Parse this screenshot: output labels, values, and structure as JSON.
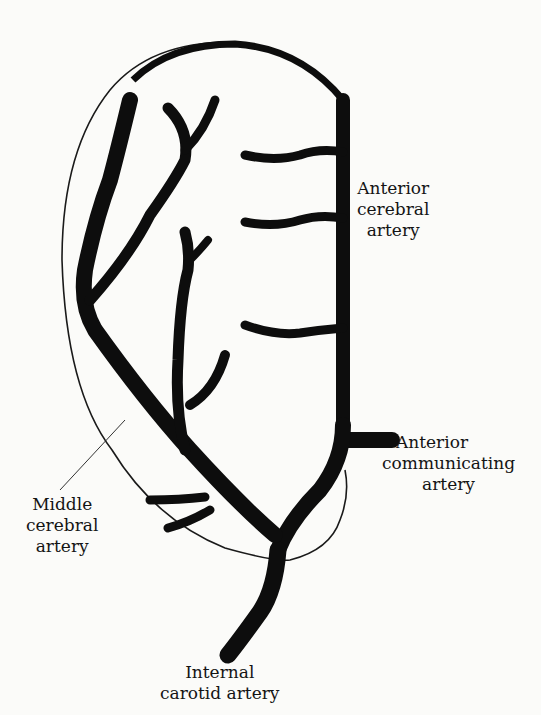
{
  "figure": {
    "colors": {
      "vessel": "#0d0d0d",
      "outline": "#1a1a1a",
      "background": "#fbfbf9"
    }
  },
  "labels": {
    "anterior_cerebral": {
      "line1": "Anterior",
      "line2": "cerebral",
      "line3": "artery"
    },
    "anterior_communicating": {
      "line1": "Anterior",
      "line2": "communicating",
      "line3": "artery"
    },
    "middle_cerebral": {
      "line1": "Middle",
      "line2": "cerebral",
      "line3": "artery"
    },
    "internal_carotid": {
      "line1": "Internal",
      "line2": "carotid artery"
    }
  }
}
